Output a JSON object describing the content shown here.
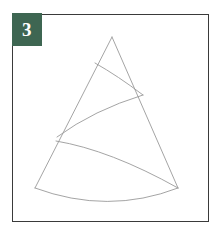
{
  "panel": {
    "name": "instruction-step-figure",
    "background_color": "#ffffff",
    "frame": {
      "border_color": "#3a3a3a",
      "border_width": 1.5,
      "x": 12,
      "y": 14,
      "width": 197,
      "height": 208
    }
  },
  "badge": {
    "label": "3",
    "background_color": "#3e6652",
    "text_color": "#ffffff"
  },
  "diagram": {
    "name": "cone-sector-with-arcs",
    "stroke_color": "#9a9a9a",
    "stroke_width": 0.9,
    "fill": "none",
    "apex": {
      "x": 112,
      "y": 37
    },
    "left_base": {
      "x": 35,
      "y": 188
    },
    "right_base": {
      "x": 178,
      "y": 188
    },
    "shapes": [
      {
        "id": "cone-left-edge",
        "type": "line",
        "from": {
          "x": 112,
          "y": 37
        },
        "to": {
          "x": 35,
          "y": 188
        }
      },
      {
        "id": "cone-right-edge",
        "type": "line",
        "from": {
          "x": 112,
          "y": 37
        },
        "to": {
          "x": 178,
          "y": 188
        }
      },
      {
        "id": "upper-arc",
        "type": "arc",
        "from": {
          "x": 95,
          "y": 63
        },
        "to": {
          "x": 143,
          "y": 95
        },
        "control": {
          "x": 118,
          "y": 76
        }
      },
      {
        "id": "middle-arc",
        "type": "arc",
        "from": {
          "x": 143,
          "y": 95
        },
        "to": {
          "x": 57,
          "y": 137
        },
        "control": {
          "x": 94,
          "y": 110
        }
      },
      {
        "id": "lower-arc",
        "type": "arc",
        "from": {
          "x": 56,
          "y": 141
        },
        "to": {
          "x": 178,
          "y": 188
        },
        "control": {
          "x": 110,
          "y": 150
        }
      },
      {
        "id": "base-arc",
        "type": "arc",
        "from": {
          "x": 35,
          "y": 188
        },
        "to": {
          "x": 178,
          "y": 188
        },
        "control": {
          "x": 108,
          "y": 215
        }
      }
    ]
  }
}
